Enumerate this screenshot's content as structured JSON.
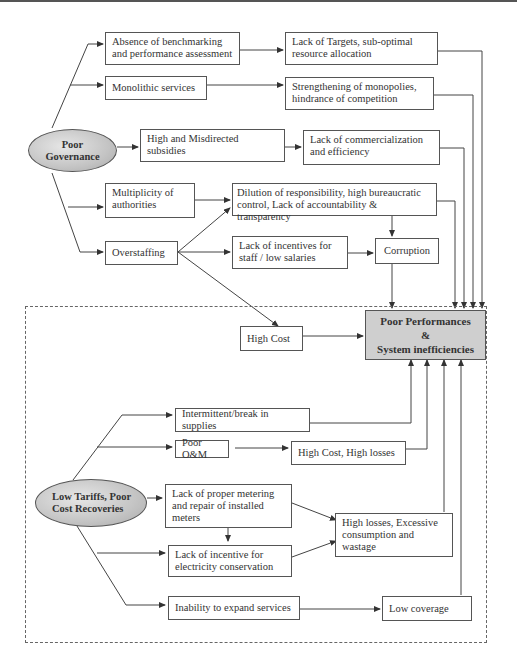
{
  "diagram": {
    "title": "",
    "roots": [
      {
        "id": "poor_governance",
        "label_lines": [
          "Poor",
          "Governance"
        ]
      },
      {
        "id": "low_tariffs",
        "label_lines": [
          "Low Tariffs, Poor",
          "Cost Recoveries"
        ]
      }
    ],
    "governance_causes": [
      {
        "id": "benchmarking",
        "label": "Absence of benchmarking and performance assessment"
      },
      {
        "id": "monolithic",
        "label": "Monolithic services"
      },
      {
        "id": "subsidies",
        "label": "High and Misdirected subsidies"
      },
      {
        "id": "multiplicity",
        "label": "Multiplicity of authorities"
      },
      {
        "id": "overstaffing",
        "label": "Overstaffing"
      }
    ],
    "governance_effects": [
      {
        "id": "targets",
        "label": "Lack of Targets, sub-optimal resource allocation"
      },
      {
        "id": "monopolies",
        "label": "Strengthening of monopolies, hindrance of competition"
      },
      {
        "id": "commercialization",
        "label": "Lack of commercialization and efficiency"
      },
      {
        "id": "dilution",
        "label": "Dilution of responsibility, high bureaucratic control, Lack of accountability & transparency"
      },
      {
        "id": "incentives_staff",
        "label": "Lack of incentives for staff / low salaries"
      },
      {
        "id": "corruption",
        "label": "Corruption"
      },
      {
        "id": "high_cost",
        "label": "High Cost"
      }
    ],
    "outcome": {
      "line1": "Poor Performances",
      "line2": "&",
      "line3": "System inefficiencies"
    },
    "tariff_causes": [
      {
        "id": "intermittent",
        "label": "Intermittent/break in supplies"
      },
      {
        "id": "poor_om",
        "label": "Poor O&M"
      },
      {
        "id": "metering",
        "label": "Lack of proper metering and repair of installed meters"
      },
      {
        "id": "conservation",
        "label": "Lack of incentive for electricity conservation"
      },
      {
        "id": "expand",
        "label": "Inability to expand services"
      }
    ],
    "tariff_effects": [
      {
        "id": "cost_losses",
        "label": "High Cost, High losses"
      },
      {
        "id": "high_losses",
        "label": "High losses, Excessive consumption and wastage"
      },
      {
        "id": "low_coverage",
        "label": "Low coverage"
      }
    ]
  }
}
